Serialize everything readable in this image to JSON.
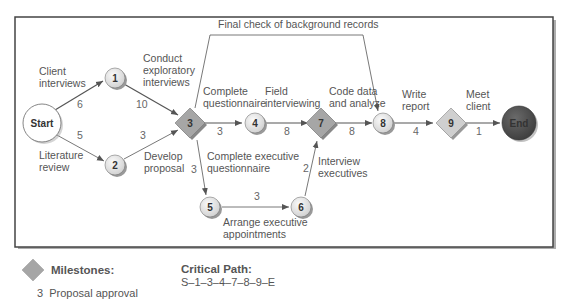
{
  "nodes": {
    "start": {
      "label": "Start"
    },
    "n1": {
      "label": "1"
    },
    "n2": {
      "label": "2"
    },
    "n3": {
      "label": "3"
    },
    "n4": {
      "label": "4"
    },
    "n5": {
      "label": "5"
    },
    "n6": {
      "label": "6"
    },
    "n7": {
      "label": "7"
    },
    "n8": {
      "label": "8"
    },
    "n9": {
      "label": "9"
    },
    "end": {
      "label": "End"
    }
  },
  "activities": {
    "client_interviews": {
      "line1": "Client",
      "line2": "interviews",
      "duration": "6"
    },
    "literature_review": {
      "line1": "Literature",
      "line2": "review",
      "duration": "5"
    },
    "conduct_exploratory": {
      "line1": "Conduct",
      "line2": "exploratory",
      "line3": "interviews",
      "duration": "10"
    },
    "develop_proposal": {
      "line1": "Develop",
      "line2": "proposal",
      "duration": "3"
    },
    "complete_questionnaire": {
      "line1": "Complete",
      "line2": "questionnaire",
      "duration": "3"
    },
    "field_interviewing": {
      "line1": "Field",
      "line2": "interviewing",
      "duration": "8"
    },
    "code_data": {
      "line1": "Code data",
      "line2": "and analyze",
      "duration": "8"
    },
    "write_report": {
      "line1": "Write",
      "line2": "report",
      "duration": "4"
    },
    "meet_client": {
      "line1": "Meet",
      "line2": "client",
      "duration": "1"
    },
    "complete_exec_questionnaire": {
      "line1": "Complete executive",
      "line2": "questionnaire",
      "duration": "3"
    },
    "arrange_exec_appointments": {
      "line1": "Arrange executive",
      "line2": "appointments",
      "duration": "3"
    },
    "interview_executives": {
      "line1": "Interview",
      "line2": "executives",
      "duration": "2"
    },
    "final_check": {
      "label": "Final check of background records"
    }
  },
  "legend": {
    "milestones_title": "Milestones:",
    "milestone_item": "3  Proposal approval",
    "critical_path_title": "Critical Path:",
    "critical_path_value": "S–1–3–4–7–8–9–E"
  },
  "colors": {
    "node_fill": "#e6e6e6",
    "milestone_fill": "#a6a6a6",
    "end_fill": "#555555",
    "frame": "#444444"
  }
}
